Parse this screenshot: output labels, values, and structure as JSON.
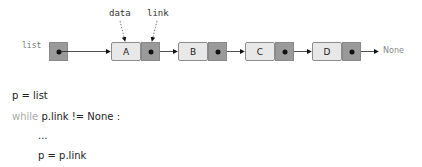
{
  "diagram": {
    "head_label": "list",
    "annotations": {
      "data": "data",
      "link": "link"
    },
    "nodes": [
      {
        "value": "A"
      },
      {
        "value": "B"
      },
      {
        "value": "C"
      },
      {
        "value": "D"
      }
    ],
    "terminal": "None"
  },
  "code": {
    "line1": "p = list",
    "line2_kw": "while",
    "line2_rest": " p.link != None :",
    "line3": "...",
    "line4": "p = p.link"
  }
}
